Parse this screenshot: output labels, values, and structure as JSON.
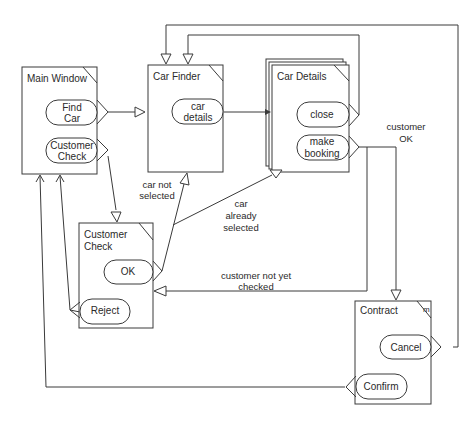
{
  "diagram": {
    "type": "window-navigation-diagram",
    "windows": [
      {
        "id": "main_window",
        "title": "Main Window",
        "buttons": [
          [
            "Find",
            "Car"
          ],
          [
            "Customer",
            "Check"
          ]
        ]
      },
      {
        "id": "car_finder",
        "title": "Car Finder",
        "buttons": [
          [
            "car",
            "details"
          ]
        ]
      },
      {
        "id": "car_details",
        "title": "Car Details",
        "multiple": true,
        "buttons": [
          [
            "close"
          ],
          [
            "make",
            "booking"
          ]
        ]
      },
      {
        "id": "customer_check",
        "title_lines": [
          "Customer",
          "Check"
        ],
        "buttons": [
          [
            "OK"
          ],
          [
            "Reject"
          ]
        ]
      },
      {
        "id": "contract",
        "title": "Contract",
        "modal_marker": "m",
        "buttons": [
          [
            "Cancel"
          ],
          [
            "Confirm"
          ]
        ]
      }
    ],
    "labels": {
      "customer_ok": [
        "customer",
        "OK"
      ],
      "car_not_selected": [
        "car not",
        "selected"
      ],
      "car_already_selected": [
        "car",
        "already",
        "selected"
      ],
      "customer_not_yet_checked": [
        "customer not yet",
        "checked"
      ]
    },
    "transitions": [
      {
        "from": "main_window.Find Car",
        "to": "car_finder"
      },
      {
        "from": "main_window.Customer Check",
        "to": "customer_check"
      },
      {
        "from": "car_finder.car details",
        "to": "car_details"
      },
      {
        "from": "car_details.close",
        "to": "car_finder"
      },
      {
        "from": "car_details.make booking",
        "to": "contract",
        "label": "customer OK"
      },
      {
        "from": "car_details.make booking",
        "to": "customer_check",
        "label": "customer not yet checked"
      },
      {
        "from": "customer_check.OK",
        "to": "car_finder",
        "label": "car not selected"
      },
      {
        "from": "customer_check.OK",
        "to": "car_details",
        "label": "car already selected"
      },
      {
        "from": "customer_check.Reject",
        "to": "main_window"
      },
      {
        "from": "contract.Cancel",
        "to": "car_finder"
      },
      {
        "from": "contract.Confirm",
        "to": "main_window"
      }
    ]
  }
}
